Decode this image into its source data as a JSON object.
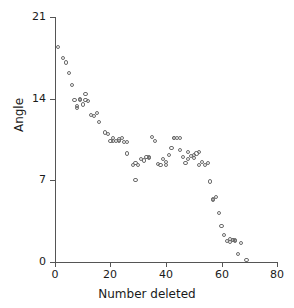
{
  "chart_data": {
    "type": "scatter",
    "title": "",
    "xlabel": "Number deleted",
    "ylabel": "Angle",
    "xlim": [
      0,
      80
    ],
    "ylim": [
      0,
      21
    ],
    "xticks": [
      0,
      20,
      40,
      60,
      80
    ],
    "yticks": [
      0,
      7,
      14,
      21
    ],
    "grid": false,
    "legend": null,
    "marker": "open-circle",
    "marker_color": "#6b6b6b",
    "series": [
      {
        "name": "angle-vs-number-deleted",
        "x": [
          1,
          3,
          4,
          5,
          6,
          7,
          8,
          8,
          9,
          9,
          10,
          11,
          11,
          12,
          13,
          14,
          15,
          16,
          18,
          19,
          20,
          21,
          21,
          22,
          23,
          23,
          24,
          25,
          26,
          26,
          28,
          29,
          29,
          30,
          31,
          32,
          33,
          34,
          34,
          35,
          36,
          37,
          38,
          39,
          40,
          40,
          41,
          42,
          43,
          43,
          44,
          45,
          45,
          46,
          47,
          48,
          48,
          49,
          50,
          50,
          51,
          52,
          52,
          53,
          54,
          55,
          56,
          57,
          57,
          58,
          59,
          60,
          61,
          62,
          63,
          63,
          64,
          64,
          65,
          65,
          66,
          67,
          69
        ],
        "y": [
          18.4,
          17.5,
          17.1,
          16.2,
          15.2,
          13.9,
          13.4,
          13.2,
          13.9,
          14.0,
          13.5,
          14.4,
          13.9,
          13.8,
          12.6,
          12.5,
          12.8,
          12.0,
          11.1,
          11.0,
          10.4,
          10.6,
          10.4,
          10.4,
          10.5,
          10.4,
          10.6,
          10.3,
          10.3,
          9.3,
          8.3,
          8.5,
          7.0,
          8.3,
          8.8,
          8.7,
          9.0,
          9.0,
          8.9,
          10.7,
          10.4,
          8.4,
          8.3,
          8.8,
          8.3,
          8.6,
          9.2,
          9.8,
          10.6,
          10.6,
          10.6,
          10.6,
          9.6,
          9.0,
          8.5,
          8.8,
          9.4,
          9.1,
          8.9,
          9.2,
          9.3,
          9.4,
          8.3,
          8.6,
          8.3,
          8.5,
          6.9,
          5.4,
          5.3,
          5.6,
          4.2,
          3.1,
          2.3,
          1.8,
          1.7,
          2.0,
          1.9,
          1.9,
          1.8,
          1.9,
          0.7,
          1.6,
          0.2
        ]
      }
    ]
  },
  "axes": {
    "y_tick_labels": [
      "0",
      "7",
      "14",
      "21"
    ],
    "x_tick_labels": [
      "0",
      "20",
      "40",
      "60",
      "80"
    ],
    "y_title": "Angle",
    "x_title": "Number deleted"
  }
}
